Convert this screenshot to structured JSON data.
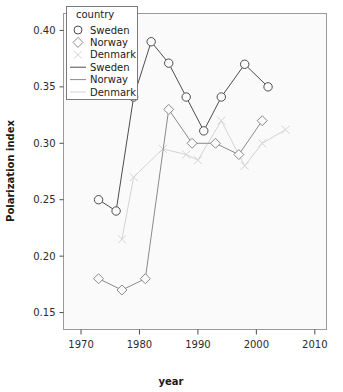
{
  "chart_data": {
    "type": "line",
    "title": "",
    "xlabel": "year",
    "ylabel": "Polarization index",
    "xlim": [
      1967,
      2012
    ],
    "ylim": [
      0.135,
      0.415
    ],
    "grid": false,
    "legend_position": "top-left inside",
    "legend_title": "country",
    "xticks": [
      1970,
      1980,
      1990,
      2000,
      2010
    ],
    "yticks": [
      "0.15",
      "0.20",
      "0.25",
      "0.30",
      "0.35",
      "0.40"
    ],
    "ytick_values": [
      0.15,
      0.2,
      0.25,
      0.3,
      0.35,
      0.4
    ],
    "series": [
      {
        "name": "Sweden",
        "marker": "circle",
        "color": "#4d4d4d",
        "x": [
          1973,
          1976,
          1979,
          1982,
          1985,
          1988,
          1991,
          1994,
          1998,
          2002
        ],
        "y": [
          0.25,
          0.24,
          0.341,
          0.39,
          0.371,
          0.341,
          0.311,
          0.341,
          0.37,
          0.35
        ]
      },
      {
        "name": "Norway",
        "marker": "diamond",
        "color": "#8a8a8a",
        "x": [
          1973,
          1977,
          1981,
          1985,
          1989,
          1993,
          1997,
          2001
        ],
        "y": [
          0.18,
          0.17,
          0.18,
          0.33,
          0.3,
          0.3,
          0.29,
          0.32
        ]
      },
      {
        "name": "Denmark",
        "marker": "tick",
        "color": "#d4d4d4",
        "x": [
          1977,
          1979,
          1984,
          1988,
          1990,
          1994,
          1998,
          2001,
          2005
        ],
        "y": [
          0.215,
          0.27,
          0.295,
          0.29,
          0.285,
          0.32,
          0.28,
          0.3,
          0.312
        ]
      }
    ],
    "legend_entries": [
      {
        "label": "Sweden",
        "type": "marker",
        "glyph": "circle",
        "color": "#4d4d4d"
      },
      {
        "label": "Norway",
        "type": "marker",
        "glyph": "diamond",
        "color": "#8a8a8a"
      },
      {
        "label": "Denmark",
        "type": "marker",
        "glyph": "tick",
        "color": "#d4d4d4"
      },
      {
        "label": "Sweden",
        "type": "line",
        "glyph": "line",
        "color": "#4d4d4d"
      },
      {
        "label": "Norway",
        "type": "line",
        "glyph": "line",
        "color": "#8a8a8a"
      },
      {
        "label": "Denmark",
        "type": "line",
        "glyph": "line",
        "color": "#d4d4d4"
      }
    ]
  },
  "colors": {
    "sweden": "#4d4d4d",
    "norway": "#8a8a8a",
    "denmark": "#d4d4d4",
    "panel_bg": "#fafafa",
    "panel_border": "#9a9a9a",
    "text": "#1a1a1a"
  }
}
